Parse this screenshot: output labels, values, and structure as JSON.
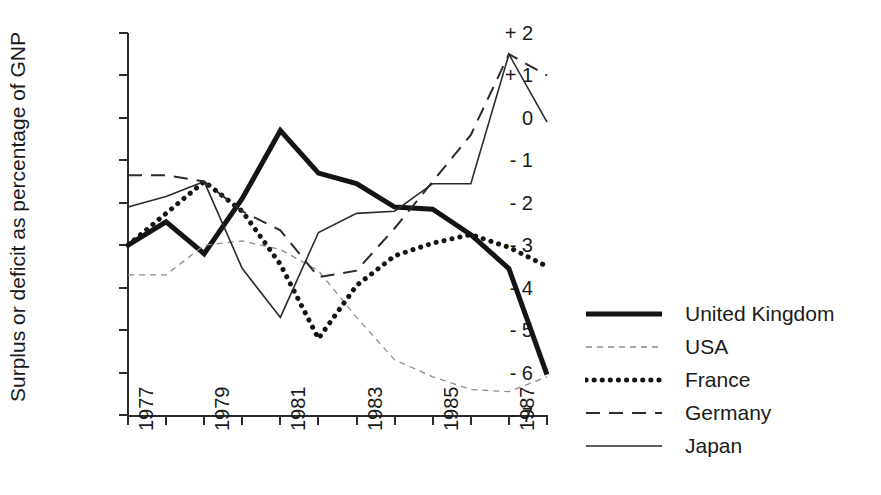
{
  "chart_data": {
    "type": "line",
    "title": "",
    "xlabel": "",
    "ylabel": "Surplus or deficit as percentage of GNP",
    "x": [
      1977,
      1978,
      1979,
      1980,
      1981,
      1982,
      1983,
      1984,
      1985,
      1986,
      1987,
      1988
    ],
    "xlim": [
      1977,
      1988
    ],
    "ylim": [
      -7,
      2
    ],
    "grid": false,
    "legend_position": "right",
    "x_tick_labels": [
      "1977",
      "",
      "1979",
      "",
      "1981",
      "",
      "1983",
      "",
      "1985",
      "",
      "1987",
      ""
    ],
    "x_tick_values": [
      1977,
      1978,
      1979,
      1980,
      1981,
      1982,
      1983,
      1984,
      1985,
      1986,
      1987,
      1988
    ],
    "y_tick_labels": [
      "+ 2",
      "+ 1",
      "0",
      "- 1",
      "- 2",
      "- 3",
      "- 4",
      "- 5",
      "- 6",
      "- 7"
    ],
    "y_tick_values": [
      2,
      1,
      0,
      -1,
      -2,
      -3,
      -4,
      -5,
      -6,
      -7
    ],
    "series": [
      {
        "name": "United Kingdom",
        "style": "solid-thick",
        "color": "#141414",
        "width": 5.0,
        "dash": "",
        "values": [
          -3.0,
          -2.45,
          -3.2,
          -1.9,
          -0.3,
          -1.3,
          -1.55,
          -2.1,
          -2.15,
          -2.75,
          -3.55,
          -6.05
        ]
      },
      {
        "name": "USA",
        "style": "fine-dash-dot",
        "color": "#8c8c8c",
        "width": 1.3,
        "dash": "6,5",
        "values": [
          -3.7,
          -3.7,
          -3.0,
          -2.9,
          -3.1,
          -3.6,
          -4.7,
          -5.7,
          -6.1,
          -6.4,
          -6.45,
          -6.1
        ]
      },
      {
        "name": "France",
        "style": "dotted",
        "color": "#141414",
        "width": 5.0,
        "dash": "0.1,8",
        "values": [
          -3.0,
          -2.25,
          -1.5,
          -2.2,
          -3.45,
          -5.2,
          -3.95,
          -3.25,
          -2.95,
          -2.75,
          -3.05,
          -3.5
        ]
      },
      {
        "name": "Germany",
        "style": "dashed",
        "color": "#2b2b2b",
        "width": 2.0,
        "dash": "14,9",
        "values": [
          -1.35,
          -1.35,
          -1.5,
          -2.2,
          -2.65,
          -3.75,
          -3.6,
          -2.6,
          -1.5,
          -0.4,
          1.5,
          1.0
        ]
      },
      {
        "name": "Japan",
        "style": "solid-thin",
        "color": "#2b2b2b",
        "width": 1.6,
        "dash": "",
        "values": [
          -2.1,
          -1.85,
          -1.5,
          -3.55,
          -4.7,
          -2.7,
          -2.25,
          -2.2,
          -1.55,
          -1.55,
          1.5,
          -0.1
        ]
      }
    ]
  },
  "legend": {
    "entries": [
      {
        "label": "United Kingdom"
      },
      {
        "label": "USA"
      },
      {
        "label": "France"
      },
      {
        "label": "Germany"
      },
      {
        "label": "Japan"
      }
    ]
  }
}
